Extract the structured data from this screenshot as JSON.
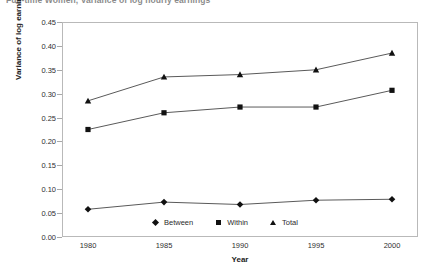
{
  "chart_data": {
    "type": "line",
    "title": "Full-time Women, Variance of log hourly earnings",
    "xlabel": "Year",
    "ylabel": "Variance of log earnings",
    "x": [
      1980,
      1985,
      1990,
      1995,
      2000
    ],
    "categories": [
      "1980",
      "1985",
      "1990",
      "1995",
      "2000"
    ],
    "xlim": [
      1978,
      2002
    ],
    "ylim": [
      0.0,
      0.45
    ],
    "grid": false,
    "legend_position": "bottom-center",
    "y_ticks": [
      "0.00",
      "0.05",
      "0.10",
      "0.15",
      "0.20",
      "0.25",
      "0.30",
      "0.35",
      "0.40",
      "0.45"
    ],
    "y_tick_values": [
      0.0,
      0.05,
      0.1,
      0.15,
      0.2,
      0.25,
      0.3,
      0.35,
      0.4,
      0.45
    ],
    "series": [
      {
        "name": "Between",
        "marker": "diamond",
        "values": [
          0.058,
          0.073,
          0.068,
          0.077,
          0.079
        ]
      },
      {
        "name": "Within",
        "marker": "square",
        "values": [
          0.225,
          0.26,
          0.272,
          0.272,
          0.307
        ]
      },
      {
        "name": "Total",
        "marker": "triangle",
        "values": [
          0.285,
          0.335,
          0.34,
          0.35,
          0.385
        ]
      }
    ],
    "colors": {
      "marker": "#111111",
      "line": "#5a5a5a",
      "frame": "#b9b9b9",
      "text": "#2f2f2f",
      "background": "#ffffff"
    }
  },
  "legend": {
    "items": [
      {
        "label": "Between",
        "glyph": "diamond-marker-icon"
      },
      {
        "label": "Within",
        "glyph": "square-marker-icon"
      },
      {
        "label": "Total",
        "glyph": "triangle-marker-icon"
      }
    ]
  }
}
